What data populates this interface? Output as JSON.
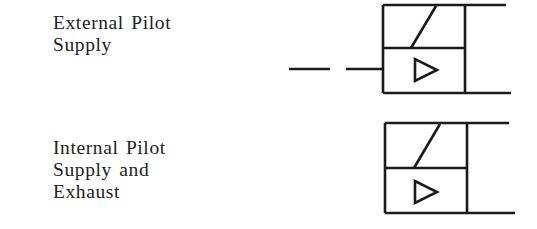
{
  "diagram": {
    "type": "pneumatic-valve-pilot-symbols",
    "colors": {
      "line": "#1a1a1a",
      "text": "#222222",
      "background": "#ffffff"
    },
    "entries": [
      {
        "label_lines": [
          "External Pilot",
          "Supply"
        ],
        "symbol": "pilot-valve-with-external-supply",
        "has_dashed_pilot_line": true
      },
      {
        "label_lines": [
          "Internal Pilot",
          "Supply and",
          "Exhaust"
        ],
        "symbol": "pilot-valve-with-internal-supply",
        "has_dashed_pilot_line": false
      }
    ]
  }
}
